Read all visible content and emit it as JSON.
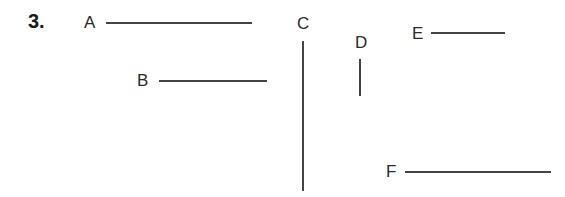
{
  "question_number": "3.",
  "segments": [
    {
      "label": "A",
      "orientation": "horizontal"
    },
    {
      "label": "B",
      "orientation": "horizontal"
    },
    {
      "label": "C",
      "orientation": "vertical"
    },
    {
      "label": "D",
      "orientation": "vertical"
    },
    {
      "label": "E",
      "orientation": "horizontal"
    },
    {
      "label": "F",
      "orientation": "horizontal"
    }
  ],
  "colors": {
    "line": "#444444",
    "text": "#2a2a2a"
  }
}
